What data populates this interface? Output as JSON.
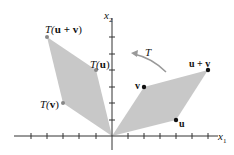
{
  "figure": {
    "axes": {
      "x_label": "x",
      "x_sub": "1",
      "y_label": "x",
      "y_sub": "2"
    },
    "arrow_label": "T",
    "original_points": {
      "u": {
        "label": "u",
        "coords": [
          4,
          1
        ]
      },
      "v": {
        "label": "v",
        "coords": [
          2,
          3
        ]
      },
      "u_plus_v": {
        "label": "u + v",
        "coords": [
          6,
          4
        ]
      }
    },
    "image_points": {
      "Tu": {
        "prefix": "T(",
        "arg": "u",
        "suffix": ")"
      },
      "Tv": {
        "prefix": "T(",
        "arg": "v",
        "suffix": ")"
      },
      "Tuv": {
        "prefix": "T(",
        "arg": "u + v",
        "suffix": ")"
      }
    },
    "colors": {
      "fill": "#c8c8c8",
      "axis": "#333333",
      "point": "#111111",
      "image_point": "#888888",
      "arrow": "#999999"
    }
  }
}
